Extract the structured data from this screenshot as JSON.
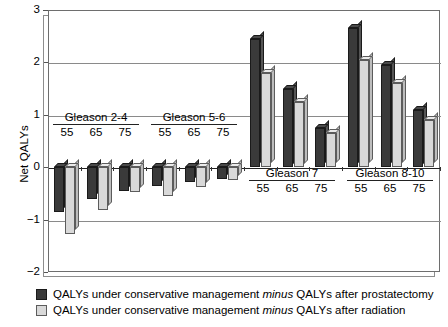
{
  "chart_data": {
    "type": "bar",
    "title": "",
    "xlabel": "",
    "ylabel": "Net QALYs",
    "ylim": [
      -2,
      3
    ],
    "yticks": [
      3,
      2,
      1,
      0,
      -1,
      -2
    ],
    "ytick_labels": [
      "3",
      "2",
      "1",
      "0",
      "−1",
      "−2"
    ],
    "grid": true,
    "legend_position": "bottom-left",
    "groups": [
      {
        "name": "Gleason 2-4",
        "ages": [
          "55",
          "65",
          "75"
        ]
      },
      {
        "name": "Gleason 5-6",
        "ages": [
          "55",
          "65",
          "75"
        ]
      },
      {
        "name": "Gleason 7",
        "ages": [
          "55",
          "65",
          "75"
        ]
      },
      {
        "name": "Gleason 8-10",
        "ages": [
          "55",
          "65",
          "75"
        ]
      }
    ],
    "categories": [
      "Gleason 2-4 / 55",
      "Gleason 2-4 / 65",
      "Gleason 2-4 / 75",
      "Gleason 5-6 / 55",
      "Gleason 5-6 / 65",
      "Gleason 5-6 / 75",
      "Gleason 7 / 55",
      "Gleason 7 / 65",
      "Gleason 7 / 75",
      "Gleason 8-10 / 55",
      "Gleason 8-10 / 65",
      "Gleason 8-10 / 75"
    ],
    "series": [
      {
        "name": "QALYs under conservative management minus QALYs after prostatectomy",
        "color": "#3a3a3a",
        "values": [
          -0.85,
          -0.6,
          -0.45,
          -0.35,
          -0.28,
          -0.22,
          2.45,
          1.5,
          0.75,
          2.65,
          1.95,
          1.1
        ]
      },
      {
        "name": "QALYs under conservative management minus QALYs after radiation",
        "color": "#d9d9d9",
        "values": [
          -1.28,
          -0.82,
          -0.48,
          -0.55,
          -0.38,
          -0.25,
          1.8,
          1.25,
          0.65,
          2.05,
          1.6,
          0.9
        ]
      }
    ]
  },
  "legend": {
    "items": [
      {
        "swatch": "dark",
        "text_before": "QALYs under conservative management ",
        "emphasis": "minus",
        "text_after": " QALYs after prostatectomy"
      },
      {
        "swatch": "light",
        "text_before": "QALYs under conservative management ",
        "emphasis": "minus",
        "text_after": " QALYs after radiation"
      }
    ]
  }
}
